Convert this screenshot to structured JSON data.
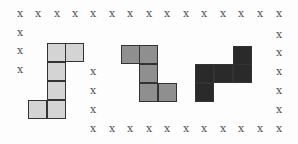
{
  "diagram": {
    "cell_size": 18.5,
    "mark_glyph": "x",
    "mark_color": "#555555",
    "marks": [
      [
        20,
        15
      ],
      [
        38,
        15
      ],
      [
        57,
        15
      ],
      [
        75,
        15
      ],
      [
        93,
        15
      ],
      [
        112,
        15
      ],
      [
        130,
        15
      ],
      [
        149,
        15
      ],
      [
        167,
        15
      ],
      [
        186,
        15
      ],
      [
        204,
        15
      ],
      [
        223,
        15
      ],
      [
        241,
        15
      ],
      [
        260,
        15
      ],
      [
        279,
        15
      ],
      [
        20,
        34
      ],
      [
        20,
        52
      ],
      [
        20,
        71
      ],
      [
        93,
        73
      ],
      [
        93,
        92
      ],
      [
        93,
        111
      ],
      [
        93,
        130
      ],
      [
        112,
        130
      ],
      [
        130,
        130
      ],
      [
        149,
        130
      ],
      [
        167,
        130
      ],
      [
        186,
        130
      ],
      [
        204,
        130
      ],
      [
        223,
        130
      ],
      [
        241,
        130
      ],
      [
        260,
        130
      ],
      [
        279,
        130
      ],
      [
        279,
        36
      ],
      [
        279,
        54
      ],
      [
        279,
        73
      ],
      [
        279,
        92
      ],
      [
        279,
        111
      ]
    ],
    "shapes": [
      {
        "name": "light-shape",
        "color": "#d4d4d4",
        "cells": [
          [
            47,
            43
          ],
          [
            65,
            43
          ],
          [
            47,
            62
          ],
          [
            47,
            81
          ],
          [
            28,
            100
          ],
          [
            47,
            100
          ]
        ]
      },
      {
        "name": "medium-shape",
        "color": "#8f8f8f",
        "cells": [
          [
            121,
            45
          ],
          [
            139,
            45
          ],
          [
            139,
            64
          ],
          [
            139,
            83
          ],
          [
            158,
            83
          ]
        ]
      },
      {
        "name": "dark-shape",
        "color": "#2a2a2a",
        "cells": [
          [
            233,
            46
          ],
          [
            195,
            64
          ],
          [
            214,
            64
          ],
          [
            233,
            64
          ],
          [
            195,
            83
          ]
        ]
      }
    ]
  }
}
